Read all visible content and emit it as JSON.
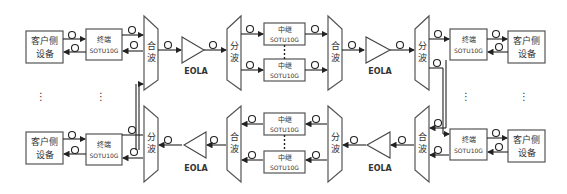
{
  "diagram": {
    "client_label_line1": "客户侧",
    "client_label_line2": "设备",
    "terminal_line1": "终端",
    "terminal_line2": "SOTU10G",
    "relay_line1": "中继",
    "relay_line2": "SOTU10G",
    "mux_line1": "合",
    "mux_line2": "波",
    "demux_line1": "分",
    "demux_line2": "波",
    "amplifier_label": "EOLA",
    "ellipsis": "⋮"
  },
  "colors": {
    "stroke": "#222222",
    "box_border": "#555555",
    "text": "#333333",
    "background": "#ffffff"
  }
}
